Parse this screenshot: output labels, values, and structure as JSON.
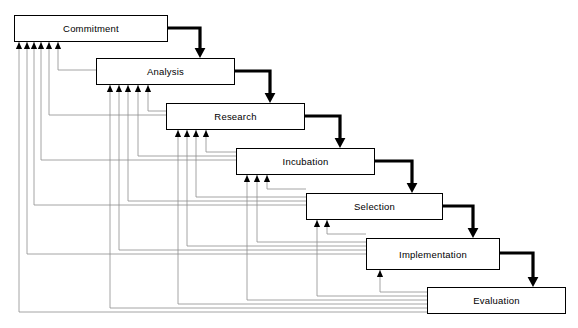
{
  "diagram": {
    "type": "waterfall-process-flow",
    "title": "",
    "background_color": "#ffffff",
    "box_border_color": "#000000",
    "box_fill_color": "#ffffff",
    "forward_arrow_color": "#000000",
    "feedback_line_color": "#808080",
    "phases": [
      {
        "id": "commitment",
        "label": "Commitment",
        "order": 1,
        "x": 14,
        "y": 15,
        "width": 154,
        "height": 27,
        "incoming_feedback_arrows": 6
      },
      {
        "id": "analysis",
        "label": "Analysis",
        "order": 2,
        "x": 96,
        "y": 58,
        "width": 139,
        "height": 27,
        "incoming_feedback_arrows": 5
      },
      {
        "id": "research",
        "label": "Research",
        "order": 3,
        "x": 166,
        "y": 103,
        "width": 139,
        "height": 27,
        "incoming_feedback_arrows": 4
      },
      {
        "id": "incubation",
        "label": "Incubation",
        "order": 4,
        "x": 236,
        "y": 148,
        "width": 139,
        "height": 27,
        "incoming_feedback_arrows": 3
      },
      {
        "id": "selection",
        "label": "Selection",
        "order": 5,
        "x": 306,
        "y": 193,
        "width": 137,
        "height": 27,
        "incoming_feedback_arrows": 2
      },
      {
        "id": "implementation",
        "label": "Implementation",
        "order": 6,
        "x": 366,
        "y": 238,
        "width": 134,
        "height": 32,
        "incoming_feedback_arrows": 1
      },
      {
        "id": "evaluation",
        "label": "Evaluation",
        "order": 7,
        "x": 427,
        "y": 287,
        "width": 139,
        "height": 27,
        "incoming_feedback_arrows": 0
      }
    ],
    "forward_flows": [
      {
        "from": "commitment",
        "to": "analysis"
      },
      {
        "from": "analysis",
        "to": "research"
      },
      {
        "from": "research",
        "to": "incubation"
      },
      {
        "from": "incubation",
        "to": "selection"
      },
      {
        "from": "selection",
        "to": "implementation"
      },
      {
        "from": "implementation",
        "to": "evaluation"
      }
    ],
    "feedback_flows": [
      {
        "from": "analysis",
        "to": "commitment"
      },
      {
        "from": "research",
        "to": "commitment"
      },
      {
        "from": "research",
        "to": "analysis"
      },
      {
        "from": "incubation",
        "to": "commitment"
      },
      {
        "from": "incubation",
        "to": "analysis"
      },
      {
        "from": "incubation",
        "to": "research"
      },
      {
        "from": "selection",
        "to": "commitment"
      },
      {
        "from": "selection",
        "to": "analysis"
      },
      {
        "from": "selection",
        "to": "research"
      },
      {
        "from": "selection",
        "to": "incubation"
      },
      {
        "from": "implementation",
        "to": "commitment"
      },
      {
        "from": "implementation",
        "to": "analysis"
      },
      {
        "from": "implementation",
        "to": "research"
      },
      {
        "from": "implementation",
        "to": "incubation"
      },
      {
        "from": "implementation",
        "to": "selection"
      },
      {
        "from": "evaluation",
        "to": "commitment"
      },
      {
        "from": "evaluation",
        "to": "analysis"
      },
      {
        "from": "evaluation",
        "to": "research"
      },
      {
        "from": "evaluation",
        "to": "incubation"
      },
      {
        "from": "evaluation",
        "to": "selection"
      },
      {
        "from": "evaluation",
        "to": "implementation"
      }
    ]
  }
}
